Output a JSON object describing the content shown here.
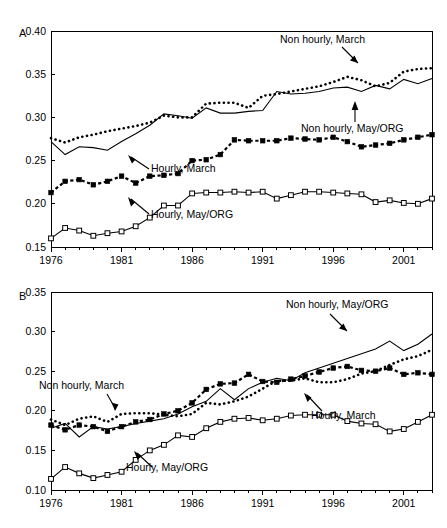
{
  "figure": {
    "background": "#ffffff",
    "ink": "#000000",
    "panels": [
      "A",
      "B"
    ]
  },
  "panel_a": {
    "letter": "A",
    "annotations": [
      {
        "name": "non-hourly-march",
        "text": "Non hourly, March"
      },
      {
        "name": "non-hourly-may-org",
        "text": "Non hourly, May/ORG"
      },
      {
        "name": "hourly-march",
        "text": "Hourly, March"
      },
      {
        "name": "hourly-may-org",
        "text": "Hourly, May/ORG"
      }
    ]
  },
  "panel_b": {
    "letter": "B",
    "annotations": [
      {
        "name": "non-hourly-may-org",
        "text": "Non hourly, May/ORG"
      },
      {
        "name": "non-hourly-march",
        "text": "Non hourly, March"
      },
      {
        "name": "hourly-march",
        "text": "Hourly, March"
      },
      {
        "name": "hourly-may-org",
        "text": "Hourly, May/ORG"
      }
    ]
  },
  "chart_data": [
    {
      "panel": "A",
      "type": "line",
      "title": "",
      "xlabel": "",
      "ylabel": "",
      "xlim": [
        1976,
        2003
      ],
      "ylim": [
        0.15,
        0.4
      ],
      "yticks": [
        "0.15",
        "0.20",
        "0.25",
        "0.30",
        "0.35",
        "0.40"
      ],
      "ytick_values": [
        0.15,
        0.2,
        0.25,
        0.3,
        0.35,
        0.4
      ],
      "xticks": [
        "1976",
        "1981",
        "1986",
        "1991",
        "1996",
        "2001"
      ],
      "xtick_values": [
        1976,
        1981,
        1986,
        1991,
        1996,
        2001
      ],
      "minor_xticks_every": 1,
      "grid": false,
      "legend": "inline annotations with leader arrows",
      "x": [
        1976,
        1977,
        1978,
        1979,
        1980,
        1981,
        1982,
        1983,
        1984,
        1985,
        1986,
        1987,
        1988,
        1989,
        1990,
        1991,
        1992,
        1993,
        1994,
        1995,
        1996,
        1997,
        1998,
        1999,
        2000,
        2001,
        2002,
        2003
      ],
      "series": [
        {
          "name": "Non hourly, March",
          "style": "dotted",
          "marker": "none",
          "values": [
            0.276,
            0.271,
            0.277,
            0.28,
            0.284,
            0.287,
            0.29,
            0.294,
            0.302,
            0.3,
            0.3,
            0.316,
            0.317,
            0.317,
            0.311,
            0.325,
            0.327,
            0.33,
            0.333,
            0.336,
            0.341,
            0.347,
            0.343,
            0.336,
            0.34,
            0.353,
            0.356,
            0.357
          ]
        },
        {
          "name": "Non hourly, May/ORG",
          "style": "solid",
          "marker": "none",
          "values": [
            0.272,
            0.257,
            0.266,
            0.265,
            0.262,
            0.272,
            0.281,
            0.291,
            0.304,
            0.302,
            0.299,
            0.311,
            0.305,
            0.305,
            0.307,
            0.308,
            0.33,
            0.327,
            0.328,
            0.33,
            0.334,
            0.335,
            0.33,
            0.337,
            0.333,
            0.344,
            0.339,
            0.345
          ]
        },
        {
          "name": "Hourly, March",
          "style": "dashed",
          "marker": "filled-square",
          "values": [
            0.213,
            0.226,
            0.228,
            0.222,
            0.226,
            0.232,
            0.224,
            0.232,
            0.233,
            0.235,
            0.25,
            0.251,
            0.257,
            0.274,
            0.273,
            0.273,
            0.273,
            0.276,
            0.275,
            0.274,
            0.277,
            0.272,
            0.266,
            0.268,
            0.27,
            0.274,
            0.277,
            0.28
          ]
        },
        {
          "name": "Hourly, May/ORG",
          "style": "solid",
          "marker": "open-square",
          "values": [
            0.16,
            0.172,
            0.169,
            0.163,
            0.166,
            0.168,
            0.174,
            0.184,
            0.198,
            0.198,
            0.212,
            0.213,
            0.213,
            0.214,
            0.213,
            0.214,
            0.206,
            0.21,
            0.214,
            0.214,
            0.213,
            0.212,
            0.211,
            0.202,
            0.204,
            0.201,
            0.2,
            0.206
          ]
        }
      ]
    },
    {
      "panel": "B",
      "type": "line",
      "title": "",
      "xlabel": "",
      "ylabel": "",
      "xlim": [
        1976,
        2003
      ],
      "ylim": [
        0.1,
        0.35
      ],
      "yticks": [
        "0.10",
        "0.15",
        "0.20",
        "0.25",
        "0.30",
        "0.35"
      ],
      "ytick_values": [
        0.1,
        0.15,
        0.2,
        0.25,
        0.3,
        0.35
      ],
      "xticks": [
        "1976",
        "1981",
        "1986",
        "1991",
        "1996",
        "2001"
      ],
      "xtick_values": [
        1976,
        1981,
        1986,
        1991,
        1996,
        2001
      ],
      "minor_xticks_every": 1,
      "grid": false,
      "legend": "inline annotations with leader arrows",
      "x": [
        1976,
        1977,
        1978,
        1979,
        1980,
        1981,
        1982,
        1983,
        1984,
        1985,
        1986,
        1987,
        1988,
        1989,
        1990,
        1991,
        1992,
        1993,
        1994,
        1995,
        1996,
        1997,
        1998,
        1999,
        2000,
        2001,
        2002,
        2003
      ],
      "series": [
        {
          "name": "Non hourly, March",
          "style": "dotted",
          "marker": "none",
          "values": [
            0.189,
            0.182,
            0.19,
            0.193,
            0.186,
            0.196,
            0.197,
            0.197,
            0.195,
            0.193,
            0.196,
            0.21,
            0.208,
            0.212,
            0.218,
            0.228,
            0.238,
            0.238,
            0.241,
            0.236,
            0.236,
            0.24,
            0.247,
            0.25,
            0.258,
            0.265,
            0.269,
            0.277,
            0.283,
            0.291,
            0.3
          ]
        },
        {
          "name": "Non hourly, May/ORG",
          "style": "solid",
          "marker": "none",
          "values": [
            0.178,
            0.184,
            0.167,
            0.18,
            0.177,
            0.18,
            0.184,
            0.187,
            0.19,
            0.196,
            0.205,
            0.212,
            0.228,
            0.214,
            0.228,
            0.236,
            0.241,
            0.238,
            0.248,
            0.254,
            0.26,
            0.266,
            0.272,
            0.278,
            0.288,
            0.276,
            0.284,
            0.297,
            0.292,
            0.3
          ]
        },
        {
          "name": "Hourly, March",
          "style": "dashed",
          "marker": "filled-square",
          "values": [
            0.182,
            0.176,
            0.182,
            0.18,
            0.174,
            0.18,
            0.186,
            0.189,
            0.196,
            0.2,
            0.21,
            0.227,
            0.234,
            0.235,
            0.246,
            0.237,
            0.236,
            0.24,
            0.244,
            0.249,
            0.254,
            0.256,
            0.251,
            0.25,
            0.254,
            0.246,
            0.248,
            0.246,
            0.25,
            0.26
          ]
        },
        {
          "name": "Hourly, May/ORG",
          "style": "solid",
          "marker": "open-square",
          "values": [
            0.114,
            0.129,
            0.121,
            0.115,
            0.119,
            0.123,
            0.138,
            0.15,
            0.157,
            0.169,
            0.167,
            0.178,
            0.186,
            0.19,
            0.191,
            0.188,
            0.19,
            0.194,
            0.195,
            0.195,
            0.195,
            0.187,
            0.184,
            0.183,
            0.174,
            0.177,
            0.186,
            0.195
          ]
        }
      ]
    }
  ]
}
